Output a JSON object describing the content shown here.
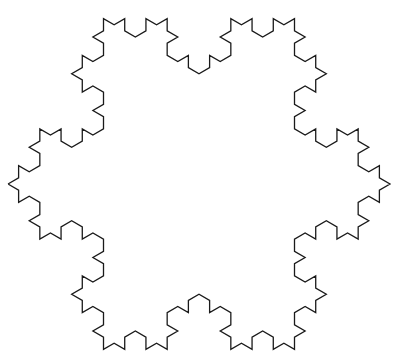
{
  "figure": {
    "kind": "koch-snowflake-outline",
    "level": 3,
    "center": [
      199,
      184
    ],
    "tip_radius": 191,
    "rotation_deg": 0,
    "stroke_color": "#1a1a1a",
    "background_color": "#ffffff",
    "stroke_width": 1.3
  }
}
